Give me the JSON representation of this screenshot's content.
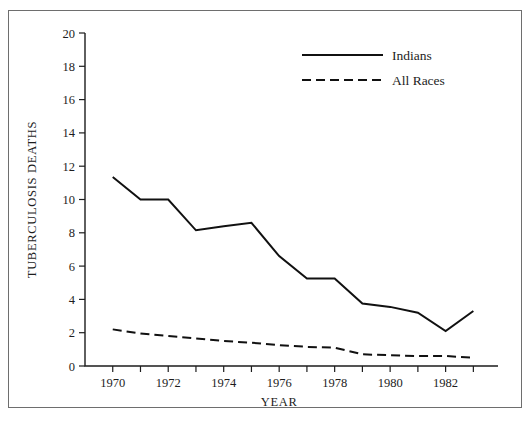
{
  "chart_data": {
    "type": "line",
    "title": "",
    "xlabel": "YEAR",
    "ylabel": "TUBERCULOSIS DEATHS",
    "xlim": [
      1969,
      1983.6
    ],
    "ylim": [
      0,
      20
    ],
    "grid": false,
    "legend_position": "top-center",
    "x": [
      1970,
      1971,
      1972,
      1973,
      1974,
      1975,
      1976,
      1977,
      1978,
      1979,
      1980,
      1981,
      1982,
      1983
    ],
    "xtick_labels": [
      "1970",
      "1972",
      "1974",
      "1976",
      "1978",
      "1980",
      "1982"
    ],
    "xtick_values": [
      1970,
      1972,
      1974,
      1976,
      1978,
      1980,
      1982
    ],
    "xminor_ticks": [
      1971,
      1973,
      1975,
      1977,
      1979,
      1981,
      1983
    ],
    "ytick_labels": [
      "0",
      "2",
      "4",
      "6",
      "8",
      "10",
      "12",
      "14",
      "16",
      "18",
      "20"
    ],
    "ytick_values": [
      0,
      2,
      4,
      6,
      8,
      10,
      12,
      14,
      16,
      18,
      20
    ],
    "series": [
      {
        "name": "Indians",
        "style": "solid",
        "color": "#111111",
        "values": [
          11.35,
          10.0,
          10.0,
          8.15,
          8.4,
          8.6,
          6.6,
          5.25,
          5.25,
          3.75,
          3.55,
          3.2,
          2.1,
          3.3
        ]
      },
      {
        "name": "All Races",
        "style": "dashed",
        "color": "#111111",
        "values": [
          2.2,
          1.95,
          1.8,
          1.65,
          1.5,
          1.4,
          1.25,
          1.15,
          1.1,
          0.7,
          0.65,
          0.6,
          0.6,
          0.5
        ]
      }
    ]
  },
  "legend": {
    "entries": [
      {
        "label": "Indians",
        "style": "solid"
      },
      {
        "label": "All Races",
        "style": "dashed"
      }
    ]
  },
  "axes": {
    "y_title": "TUBERCULOSIS DEATHS",
    "x_title": "YEAR"
  }
}
